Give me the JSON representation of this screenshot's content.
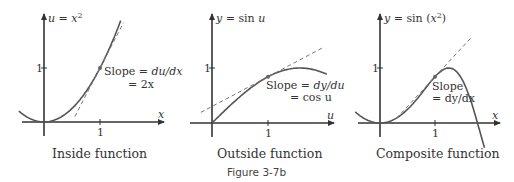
{
  "figure_label": "Figure 3-7b",
  "panels": [
    {
      "id": "inside",
      "caption": "Inside function",
      "equation": {
        "lhs": "u",
        "eq": " = ",
        "rhs": "x",
        "sup": "2"
      },
      "x_axis_label": "x",
      "x_tick": "1",
      "y_tick": "1",
      "slope_line1": {
        "text": "Slope = ",
        "italic": "du/dx"
      },
      "slope_line2": "= 2x",
      "point": [
        1,
        1
      ],
      "slope": 2
    },
    {
      "id": "outside",
      "caption": "Outside function",
      "equation": {
        "lhs": "y",
        "eq": " = sin ",
        "rhs": "u"
      },
      "x_axis_label": "u",
      "x_tick": "1",
      "y_tick": "1",
      "slope_line1": {
        "text": "Slope = ",
        "italic": "dy/du"
      },
      "slope_line2": "= cos u",
      "point": [
        1,
        0.841
      ],
      "slope": 0.54
    },
    {
      "id": "composite",
      "caption": "Composite function",
      "equation": {
        "lhs": "y",
        "eq": " = sin (",
        "rhs": "x",
        "sup": "2",
        "close": ")"
      },
      "x_axis_label": "x",
      "x_tick": "1",
      "y_tick": "1",
      "slope_line1": {
        "text": "Slope",
        "italic": ""
      },
      "slope_line2": "= dy/dx",
      "point": [
        1,
        0.841
      ],
      "slope": 1.081
    }
  ]
}
